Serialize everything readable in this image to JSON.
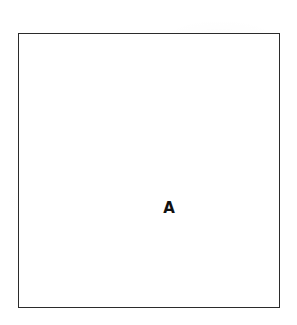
{
  "figure": {
    "type": "figure-panel",
    "background_color": "#ffffff",
    "frame": {
      "name": "rectangular-outline",
      "stroke_color": "#2b2b2b",
      "fill_color": "#ffffff",
      "stroke_width_px": 1.3,
      "x_px": 18,
      "y_px": 33,
      "width_px": 262,
      "height_px": 275
    },
    "panel_label": {
      "text": "A",
      "color": "#111111",
      "font_size_px": 15,
      "font_weight": "bold",
      "x_px": 148,
      "y_px": 174
    },
    "contents": []
  }
}
